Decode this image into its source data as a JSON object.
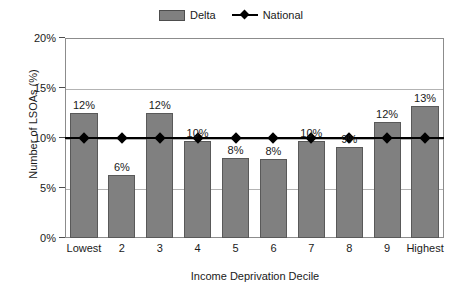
{
  "chart_data": {
    "type": "bar",
    "title": "",
    "xlabel": "Income Deprivation Decile",
    "ylabel": "Number of LSOAs (%)",
    "categories": [
      "Lowest",
      "2",
      "3",
      "4",
      "5",
      "6",
      "7",
      "8",
      "9",
      "Highest"
    ],
    "ylim": [
      0,
      20
    ],
    "yticks": [
      "0%",
      "5%",
      "10%",
      "15%",
      "20%"
    ],
    "ytick_values": [
      0,
      5,
      10,
      15,
      20
    ],
    "grid": true,
    "legend_position": "top-center",
    "series": [
      {
        "name": "Delta",
        "type": "bar",
        "color": "#808080",
        "values": [
          12.5,
          6.3,
          12.5,
          9.7,
          8.0,
          7.9,
          9.7,
          9.1,
          11.6,
          13.2
        ],
        "data_labels": [
          "12%",
          "6%",
          "12%",
          "10%",
          "8%",
          "8%",
          "10%",
          "9%",
          "12%",
          "13%"
        ]
      },
      {
        "name": "National",
        "type": "line",
        "color": "#000000",
        "marker": "diamond",
        "values": [
          10,
          10,
          10,
          10,
          10,
          10,
          10,
          10,
          10,
          10
        ]
      }
    ]
  },
  "legend": {
    "entries": [
      {
        "label": "Delta",
        "icon": "bar-swatch-icon"
      },
      {
        "label": "National",
        "icon": "line-diamond-swatch-icon"
      }
    ]
  }
}
